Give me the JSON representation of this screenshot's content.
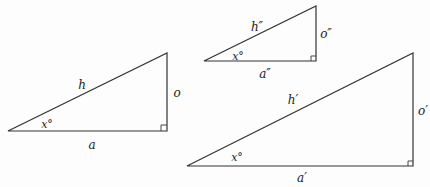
{
  "diagram": {
    "colors": {
      "line": "#333333",
      "text": "#222222",
      "background": "#fdfdfd"
    },
    "triangles": [
      {
        "id": "triangle-a",
        "points": {
          "left": [
            8,
            131
          ],
          "right": [
            167,
            131
          ],
          "top": [
            167,
            53
          ]
        },
        "labels": {
          "hypotenuse": {
            "text": "h",
            "pos": [
              82,
              85
            ]
          },
          "opposite": {
            "text": "o",
            "pos": [
              177,
              93
            ]
          },
          "angle": {
            "text": "x°",
            "pos": [
              47,
              124
            ]
          },
          "adjacent": {
            "text": "a",
            "pos": [
              92,
              145
            ]
          }
        }
      },
      {
        "id": "triangle-double-prime",
        "points": {
          "left": [
            204,
            61
          ],
          "right": [
            316,
            61
          ],
          "top": [
            316,
            6
          ]
        },
        "labels": {
          "hypotenuse": {
            "text": "h″",
            "pos": [
              257,
              27
            ]
          },
          "opposite": {
            "text": "o″",
            "pos": [
              326,
              34
            ]
          },
          "angle": {
            "text": "x°",
            "pos": [
              238,
              56
            ]
          },
          "adjacent": {
            "text": "a″",
            "pos": [
              265,
              74
            ]
          }
        }
      },
      {
        "id": "triangle-prime",
        "points": {
          "left": [
            187,
            166
          ],
          "right": [
            413,
            166
          ],
          "top": [
            413,
            53
          ]
        },
        "labels": {
          "hypotenuse": {
            "text": "h′",
            "pos": [
              293,
              100
            ]
          },
          "opposite": {
            "text": "o′",
            "pos": [
              423,
              111
            ]
          },
          "angle": {
            "text": "x°",
            "pos": [
              237,
              157
            ]
          },
          "adjacent": {
            "text": "a′",
            "pos": [
              302,
              178
            ]
          }
        }
      }
    ]
  }
}
